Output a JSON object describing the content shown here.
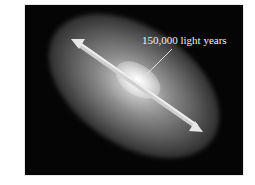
{
  "figure": {
    "annotation": {
      "label": "150,000 light years"
    },
    "colors": {
      "background": "#050505",
      "arrow": "#d8d8d8",
      "label": "#f2f2f2",
      "page": "#ffffff"
    }
  }
}
